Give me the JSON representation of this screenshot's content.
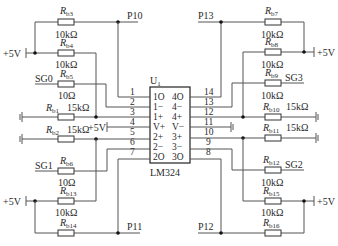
{
  "ic": {
    "ref": "U",
    "ref_sub": "1",
    "part": "LM324",
    "pins_left": [
      {
        "num": "1",
        "name": "1O"
      },
      {
        "num": "2",
        "name": "1−"
      },
      {
        "num": "3",
        "name": "1+"
      },
      {
        "num": "4",
        "name": "V+"
      },
      {
        "num": "5",
        "name": "2+"
      },
      {
        "num": "6",
        "name": "2−"
      },
      {
        "num": "7",
        "name": "2O"
      }
    ],
    "pins_right": [
      {
        "num": "14",
        "name": "4O"
      },
      {
        "num": "13",
        "name": "4−"
      },
      {
        "num": "12",
        "name": "4+"
      },
      {
        "num": "11",
        "name": "V−"
      },
      {
        "num": "10",
        "name": "3+"
      },
      {
        "num": "9",
        "name": "3−"
      },
      {
        "num": "8",
        "name": "3O"
      }
    ]
  },
  "nets": {
    "p10": "P10",
    "p11": "P11",
    "p12": "P12",
    "p13": "P13",
    "sg0": "SG0",
    "sg1": "SG1",
    "sg2": "SG2",
    "sg3": "SG3",
    "vcc": "+5V"
  },
  "resistors": {
    "rb1": {
      "name": "R",
      "sub": "b1",
      "value": "15kΩ"
    },
    "rb2": {
      "name": "R",
      "sub": "b2",
      "value": "15kΩ"
    },
    "rb3": {
      "name": "R",
      "sub": "b3",
      "value": "10kΩ"
    },
    "rb4": {
      "name": "R",
      "sub": "b4",
      "value": "10kΩ"
    },
    "rb5": {
      "name": "R",
      "sub": "b5",
      "value": "10Ω"
    },
    "rb6": {
      "name": "R",
      "sub": "b6",
      "value": "10Ω"
    },
    "rb7": {
      "name": "R",
      "sub": "b7",
      "value": "10kΩ"
    },
    "rb8": {
      "name": "R",
      "sub": "b8",
      "value": "10kΩ"
    },
    "rb9": {
      "name": "R",
      "sub": "b9",
      "value": "10kΩ"
    },
    "rb10": {
      "name": "R",
      "sub": "b10",
      "value": "15kΩ"
    },
    "rb11": {
      "name": "R",
      "sub": "b11",
      "value": "15kΩ"
    },
    "rb12": {
      "name": "R",
      "sub": "b12",
      "value": "10kΩ"
    },
    "rb13": {
      "name": "R",
      "sub": "b13",
      "value": "10kΩ"
    },
    "rb14": {
      "name": "R",
      "sub": "b14",
      "value": ""
    },
    "rb15": {
      "name": "R",
      "sub": "b15",
      "value": "10kΩ"
    },
    "rb16": {
      "name": "R",
      "sub": "b16",
      "value": ""
    }
  }
}
